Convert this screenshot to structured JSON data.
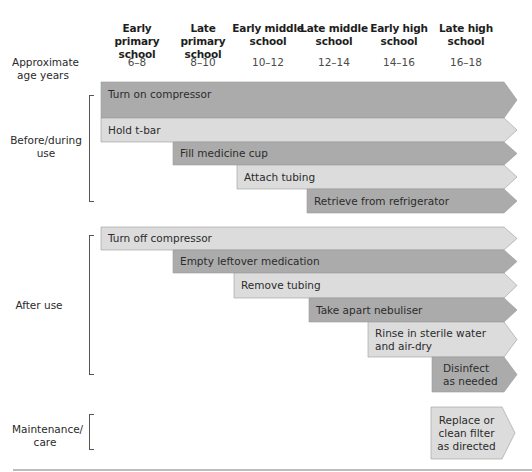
{
  "colors": {
    "dark": "#ababab",
    "light": "#dcdcdc",
    "stroke": "#9a9a9a",
    "bottom_line": "#bdbdbd"
  },
  "header": {
    "age_label": "Approximate age years",
    "columns": [
      {
        "label": "Early primary school",
        "age": "6–8",
        "center": 137
      },
      {
        "label": "Late primary school",
        "age": "8–10",
        "center": 203
      },
      {
        "label": "Early middle school",
        "age": "10–12",
        "center": 268
      },
      {
        "label": "Late middle school",
        "age": "12–14",
        "center": 334
      },
      {
        "label": "Early high school",
        "age": "14–16",
        "center": 399
      },
      {
        "label": "Late high school",
        "age": "16–18",
        "center": 466
      }
    ]
  },
  "sections": [
    {
      "label": "Before/during use",
      "tasks": [
        {
          "label": "Turn on compressor",
          "shade": "dark",
          "x": 101,
          "y": 82,
          "h": 36
        },
        {
          "label": "Hold t-bar",
          "shade": "light",
          "x": 101,
          "y": 118,
          "h": 24
        },
        {
          "label": "Fill medicine cup",
          "shade": "dark",
          "x": 173,
          "y": 142,
          "h": 23
        },
        {
          "label": "Attach tubing",
          "shade": "light",
          "x": 237,
          "y": 165,
          "h": 24
        },
        {
          "label": "Retrieve from refrigerator",
          "shade": "dark",
          "x": 307,
          "y": 189,
          "h": 24
        }
      ]
    },
    {
      "label": "After use",
      "tasks": [
        {
          "label": "Turn off compressor",
          "shade": "light",
          "x": 101,
          "y": 227,
          "h": 23
        },
        {
          "label": "Empty leftover medication",
          "shade": "dark",
          "x": 173,
          "y": 250,
          "h": 23
        },
        {
          "label": "Remove tubing",
          "shade": "light",
          "x": 234,
          "y": 273,
          "h": 25
        },
        {
          "label": "Take apart nebuliser",
          "shade": "dark",
          "x": 309,
          "y": 298,
          "h": 24
        },
        {
          "label": "Rinse in sterile water\nand air-dry",
          "shade": "light",
          "x": 368,
          "y": 322,
          "h": 35
        },
        {
          "label": "Disinfect\nas needed",
          "shade": "dark",
          "x": 432,
          "y": 357,
          "h": 35
        }
      ]
    },
    {
      "label": "Maintenance/ care",
      "tasks": [
        {
          "label": "Replace or\nclean filter\nas directed",
          "shade": "light",
          "x": 431,
          "y": 407,
          "h": 52
        }
      ]
    }
  ]
}
